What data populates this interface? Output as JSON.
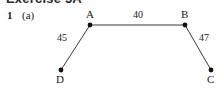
{
  "page": {
    "heading_sliver": "Exercise 5A",
    "question_number": "1",
    "question_part": "(a)",
    "background_color": "#ffffff",
    "ink_color": "#1a1a1a"
  },
  "figure": {
    "type": "network-diagram",
    "shape": "trapezium",
    "nodes": [
      {
        "id": "A",
        "label": "A",
        "x": 90,
        "y": 25
      },
      {
        "id": "B",
        "label": "B",
        "x": 185,
        "y": 25
      },
      {
        "id": "C",
        "label": "C",
        "x": 211,
        "y": 70
      },
      {
        "id": "D",
        "label": "D",
        "x": 61,
        "y": 70
      }
    ],
    "edges": [
      {
        "from": "A",
        "to": "B",
        "weight": "40",
        "label_x": 133,
        "label_y": 10
      },
      {
        "from": "A",
        "to": "D",
        "weight": "45",
        "label_x": 57,
        "label_y": 33
      },
      {
        "from": "B",
        "to": "C",
        "weight": "47",
        "label_x": 199,
        "label_y": 33
      }
    ],
    "node_dot_radius": 2.4,
    "line_color": "#3a3a3a",
    "line_width": 1
  }
}
